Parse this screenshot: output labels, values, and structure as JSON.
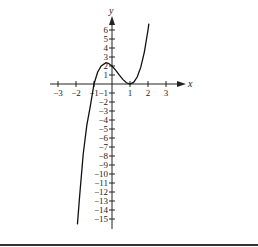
{
  "chart_data": {
    "type": "line",
    "title": "",
    "xlabel": "x",
    "ylabel": "y",
    "xlim": [
      -3,
      3
    ],
    "ylim": [
      -15,
      6
    ],
    "grid": false,
    "legend": null,
    "x_ticks": [
      -3,
      -2,
      -1,
      1,
      2,
      3
    ],
    "x_tick_labels": [
      "−3",
      "−2",
      "−1",
      "1",
      "2",
      "3"
    ],
    "y_ticks": [
      6,
      5,
      4,
      3,
      2,
      1,
      -1,
      -2,
      -3,
      -4,
      -5,
      -6,
      -7,
      -8,
      -9,
      -10,
      -11,
      -12,
      -13,
      -14,
      -15
    ],
    "y_tick_labels": [
      "6",
      "5",
      "4",
      "3",
      "2",
      "1",
      "−1",
      "−2",
      "−3",
      "−4",
      "−5",
      "−6",
      "−7",
      "−8",
      "−9",
      "−10",
      "−11",
      "−12",
      "−13",
      "−14",
      "−15"
    ],
    "series": [
      {
        "name": "f(x)",
        "description": "cubic with zero at x=-1, double root (tangent) at x=1, y-intercept 2, local max ~2.4 near x=-1/3",
        "x": [
          -1.92,
          -1.8,
          -1.6,
          -1.4,
          -1.2,
          -1.0,
          -0.8,
          -0.6,
          -0.333,
          -0.2,
          0.0,
          0.2,
          0.4,
          0.6,
          0.8,
          1.0,
          1.2,
          1.4,
          1.6,
          1.8,
          2.0,
          2.05
        ],
        "y": [
          -15.6,
          -12.5,
          -7.8,
          -4.6,
          -2.4,
          0.0,
          1.3,
          2.0,
          2.37,
          2.3,
          2.0,
          1.54,
          1.01,
          0.51,
          0.14,
          0.0,
          0.18,
          0.77,
          1.87,
          3.58,
          6.0,
          6.7
        ]
      }
    ]
  }
}
